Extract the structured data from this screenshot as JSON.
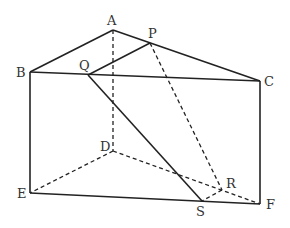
{
  "diagram": {
    "points": {
      "A": {
        "x": 113,
        "y": 30,
        "label": "A",
        "lx": 107,
        "ly": 25
      },
      "B": {
        "x": 30,
        "y": 72,
        "label": "B",
        "lx": 16,
        "ly": 77
      },
      "C": {
        "x": 260,
        "y": 81,
        "label": "C",
        "lx": 264,
        "ly": 86
      },
      "P": {
        "x": 150,
        "y": 43,
        "label": "P",
        "lx": 148,
        "ly": 38
      },
      "Q": {
        "x": 88,
        "y": 75,
        "label": "Q",
        "lx": 79,
        "ly": 70
      },
      "D": {
        "x": 113,
        "y": 151,
        "label": "D",
        "lx": 100,
        "ly": 151
      },
      "E": {
        "x": 30,
        "y": 193,
        "label": "E",
        "lx": 17,
        "ly": 198
      },
      "F": {
        "x": 260,
        "y": 204,
        "label": "F",
        "lx": 266,
        "ly": 209
      },
      "R": {
        "x": 222,
        "y": 190,
        "label": "R",
        "lx": 226,
        "ly": 188
      },
      "S": {
        "x": 202,
        "y": 201,
        "label": "S",
        "lx": 196,
        "ly": 216
      }
    },
    "solid_edges": [
      [
        "A",
        "B"
      ],
      [
        "A",
        "C"
      ],
      [
        "B",
        "C"
      ],
      [
        "B",
        "E"
      ],
      [
        "C",
        "F"
      ],
      [
        "E",
        "F"
      ],
      [
        "Q",
        "P"
      ],
      [
        "Q",
        "S"
      ]
    ],
    "dashed_edges": [
      [
        "A",
        "D"
      ],
      [
        "D",
        "E"
      ],
      [
        "D",
        "F"
      ],
      [
        "P",
        "R"
      ],
      [
        "R",
        "S"
      ]
    ],
    "colors": {
      "line": "#222222",
      "label": "#333333",
      "background": "#ffffff"
    }
  }
}
